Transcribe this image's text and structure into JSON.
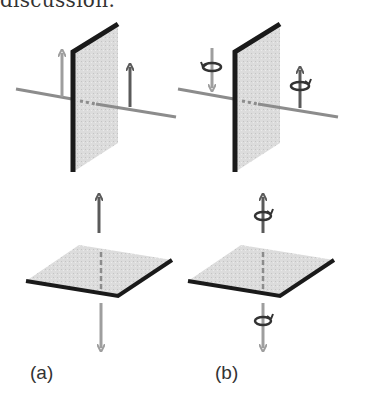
{
  "caption_fragment": "discussion.",
  "panels": [
    {
      "id": "a",
      "label": "(a)",
      "description": "Linear (translational) arrows on a vertical plate and a horizontal plate"
    },
    {
      "id": "b",
      "label": "(b)",
      "description": "Arrows with rotation (circulation) symbols on a vertical plate and a horizontal plate"
    }
  ],
  "colors": {
    "plate_fill": "#d9d9d9",
    "plate_edge": "#1a1a1a",
    "axis_line": "#8c8c8c",
    "arrow_dark": "#5a5a5a",
    "arrow_light": "#9e9e9e"
  }
}
